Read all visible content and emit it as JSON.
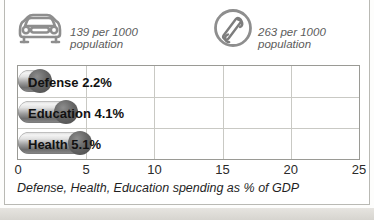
{
  "stats": [
    {
      "icon": "car-icon",
      "value_line1": "139 per 1000",
      "value_line2": "population",
      "value": 139,
      "unit": "per 1000 population",
      "subject": "cars"
    },
    {
      "icon": "telephone-icon",
      "value_line1": "263 per 1000",
      "value_line2": "population",
      "value": 263,
      "unit": "per 1000 population",
      "subject": "telephones"
    }
  ],
  "caption": "Defense, Health, Education spending as % of GDP",
  "colors": {
    "bar_dark": "#6e6e6e",
    "bar_light": "#f4f4f4",
    "bar_cap": "#4a4a4a",
    "grid": "#c9c9c4",
    "border": "#9a9a95",
    "text": "#111111",
    "muted_text": "#5c5c5c"
  },
  "chart_data": {
    "type": "bar",
    "orientation": "horizontal",
    "title": "",
    "subtitle": "",
    "xlabel": "Defense, Health, Education spending as % of GDP",
    "ylabel": "",
    "categories": [
      "Defense",
      "Education",
      "Health"
    ],
    "values": [
      2.2,
      4.1,
      5.1
    ],
    "value_labels": [
      "2.2%",
      "4.1%",
      "5.1%"
    ],
    "bar_labels": [
      "Defense 2.2%",
      "Education 4.1%",
      "Health 5.1%"
    ],
    "xlim": [
      0,
      25
    ],
    "ticks": [
      0,
      5,
      10,
      15,
      20,
      25
    ],
    "tick_labels": [
      "0",
      "5",
      "10",
      "15",
      "20",
      "25"
    ],
    "grid": true,
    "gridlines_at": [
      5,
      10,
      15,
      20
    ],
    "legend": "none",
    "units": "% of GDP"
  }
}
